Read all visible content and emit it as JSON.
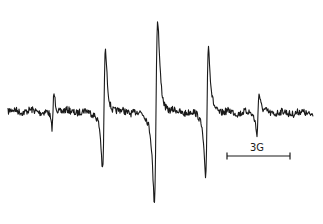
{
  "chart_data": {
    "type": "line",
    "title": "",
    "xlabel": "",
    "ylabel": "",
    "grid": false,
    "axes_visible": false,
    "line_color": "#1a1a1a",
    "lines": [
      {
        "index": 1,
        "center_x_px": 53,
        "peak_y_px": 90,
        "trough_y_px": 131
      },
      {
        "index": 2,
        "center_x_px": 104,
        "peak_y_px": 38,
        "trough_y_px": 180
      },
      {
        "index": 3,
        "center_x_px": 156,
        "peak_y_px": 2,
        "trough_y_px": 215
      },
      {
        "index": 4,
        "center_x_px": 207,
        "peak_y_px": 38,
        "trough_y_px": 190
      },
      {
        "index": 5,
        "center_x_px": 258,
        "peak_y_px": 90,
        "trough_y_px": 137
      }
    ],
    "baseline_y_px": 111,
    "x_range_px": [
      8,
      313
    ],
    "scale_bar": {
      "label": "3G",
      "x_start_px": 227,
      "x_end_px": 290,
      "y_px": 156
    }
  },
  "scale_bar": {
    "label": "3G"
  }
}
